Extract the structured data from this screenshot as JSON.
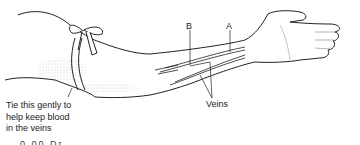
{
  "figure": {
    "labels": {
      "a": "A",
      "b": "B",
      "veins": "Veins"
    },
    "caption_lines": [
      "Tie this gently to",
      "help keep blood",
      "in the veins"
    ],
    "partial_text": "0.00  Dr..."
  }
}
